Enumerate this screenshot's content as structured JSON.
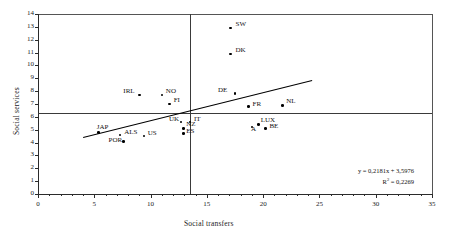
{
  "chart_data": {
    "type": "scatter",
    "title": "",
    "xlabel": "Social transfers",
    "ylabel": "Social services",
    "xlim": [
      0,
      35
    ],
    "ylim": [
      0,
      14
    ],
    "xticks": [
      0,
      5,
      10,
      15,
      20,
      25,
      30,
      35
    ],
    "yticks": [
      0,
      1,
      2,
      3,
      4,
      5,
      6,
      7,
      8,
      9,
      10,
      11,
      12,
      13,
      14
    ],
    "grid": false,
    "legend": null,
    "points": [
      {
        "label": "SW",
        "x": 17.1,
        "y": 12.9
      },
      {
        "label": "DK",
        "x": 17.1,
        "y": 10.9
      },
      {
        "label": "DE",
        "x": 17.5,
        "y": 7.8
      },
      {
        "label": "NO",
        "x": 11.0,
        "y": 7.7
      },
      {
        "label": "IRL",
        "x": 9.0,
        "y": 7.7
      },
      {
        "label": "FI",
        "x": 11.7,
        "y": 7.0
      },
      {
        "label": "FR",
        "x": 18.7,
        "y": 6.8
      },
      {
        "label": "NL",
        "x": 21.7,
        "y": 6.9
      },
      {
        "label": "UK",
        "x": 12.7,
        "y": 5.6
      },
      {
        "label": "IT",
        "x": 13.5,
        "y": 5.6
      },
      {
        "label": "A",
        "x": 19.0,
        "y": 5.2
      },
      {
        "label": "LUX",
        "x": 19.6,
        "y": 5.4
      },
      {
        "label": "BE",
        "x": 20.2,
        "y": 5.1
      },
      {
        "label": "NZ",
        "x": 12.9,
        "y": 5.1
      },
      {
        "label": "ES",
        "x": 12.9,
        "y": 4.7
      },
      {
        "label": "ALS",
        "x": 7.3,
        "y": 4.6
      },
      {
        "label": "US",
        "x": 9.4,
        "y": 4.5
      },
      {
        "label": "JAP",
        "x": 5.4,
        "y": 4.8
      },
      {
        "label": "POR",
        "x": 7.6,
        "y": 4.1
      }
    ],
    "trendline": {
      "slope": 0.2181,
      "intercept": 3.5976,
      "x_start": 4.0,
      "x_end": 24.3,
      "equation": "y = 0,2181x + 3,5976",
      "r_squared_label": "R",
      "r_squared_sup": "2",
      "r_squared_value": " = 0,2269"
    },
    "reference_lines": [
      {
        "orientation": "vertical",
        "value": 13.5
      },
      {
        "orientation": "horizontal",
        "value": 6.3
      }
    ]
  }
}
